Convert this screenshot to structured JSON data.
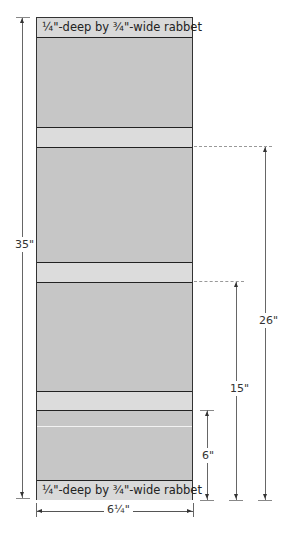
{
  "diagram": {
    "panel": {
      "top_label": "¼\"-deep by ¾\"-wide rabbet",
      "bottom_label": "¼\"-deep by ¾\"-wide rabbet",
      "colors": {
        "board": "#c6c6c6",
        "band": "#dcdcdc",
        "outline": "#333333"
      }
    },
    "dimensions": {
      "overall_height": "35\"",
      "width": "6¼\"",
      "to_upper_band": "26\"",
      "to_middle_band": "15\"",
      "to_lower_band": "6\""
    }
  }
}
